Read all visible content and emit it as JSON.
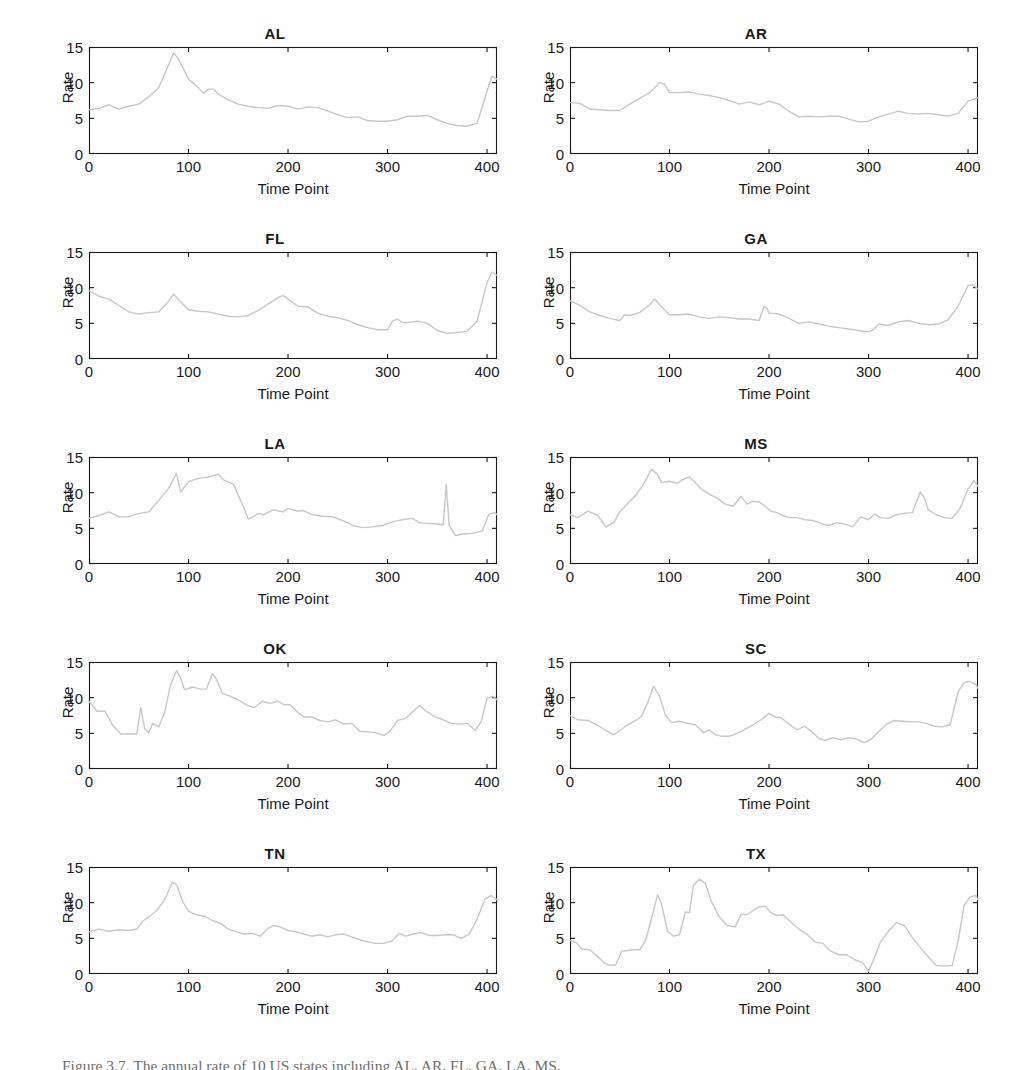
{
  "figure": {
    "caption": "Figure 3.7.   The annual rate of 10 US states including AL, AR, FL, GA, LA, MS,",
    "line_color": "#c8c8c8",
    "axis_color": "#1a1a1a"
  },
  "chart_data": [
    {
      "type": "line",
      "title": "AL",
      "xlabel": "Time Point",
      "ylabel": "Rate",
      "xlim": [
        0,
        410
      ],
      "ylim": [
        0,
        15
      ],
      "xticks": [
        0,
        100,
        200,
        300,
        400
      ],
      "yticks": [
        0,
        5,
        10,
        15
      ],
      "grid": false,
      "legend": "none",
      "x": [
        0,
        10,
        20,
        30,
        40,
        50,
        60,
        70,
        80,
        85,
        90,
        100,
        110,
        115,
        120,
        125,
        130,
        140,
        150,
        160,
        170,
        180,
        190,
        200,
        210,
        220,
        230,
        240,
        250,
        260,
        270,
        280,
        290,
        300,
        310,
        320,
        330,
        340,
        350,
        360,
        370,
        380,
        390,
        400,
        405,
        410
      ],
      "values": [
        6.2,
        6.4,
        6.9,
        6.3,
        6.7,
        7.0,
        8.0,
        9.3,
        12.5,
        14.2,
        13.3,
        10.5,
        9.3,
        8.5,
        9.1,
        9.1,
        8.4,
        7.6,
        7.0,
        6.7,
        6.5,
        6.4,
        6.8,
        6.7,
        6.3,
        6.6,
        6.5,
        6.0,
        5.5,
        5.1,
        5.2,
        4.7,
        4.6,
        4.6,
        4.8,
        5.3,
        5.3,
        5.4,
        4.8,
        4.3,
        4.0,
        3.9,
        4.3,
        8.8,
        10.9,
        10.5
      ]
    },
    {
      "type": "line",
      "title": "AR",
      "xlabel": "Time Point",
      "ylabel": "Rate",
      "xlim": [
        0,
        410
      ],
      "ylim": [
        0,
        15
      ],
      "xticks": [
        0,
        100,
        200,
        300,
        400
      ],
      "yticks": [
        0,
        5,
        10,
        15
      ],
      "grid": false,
      "legend": "none",
      "x": [
        0,
        10,
        20,
        30,
        40,
        50,
        60,
        70,
        80,
        90,
        95,
        100,
        110,
        120,
        130,
        140,
        150,
        160,
        170,
        180,
        190,
        200,
        210,
        220,
        230,
        240,
        250,
        260,
        270,
        280,
        290,
        300,
        310,
        320,
        330,
        340,
        350,
        360,
        370,
        380,
        390,
        400,
        410
      ],
      "values": [
        7.2,
        7.1,
        6.3,
        6.2,
        6.1,
        6.1,
        7.0,
        7.8,
        8.6,
        10.0,
        9.8,
        8.6,
        8.6,
        8.7,
        8.4,
        8.2,
        7.9,
        7.5,
        7.0,
        7.3,
        6.9,
        7.4,
        7.0,
        6.0,
        5.2,
        5.3,
        5.2,
        5.3,
        5.3,
        4.9,
        4.5,
        4.6,
        5.2,
        5.6,
        6.0,
        5.7,
        5.6,
        5.7,
        5.5,
        5.3,
        5.7,
        7.4,
        7.9
      ]
    },
    {
      "type": "line",
      "title": "FL",
      "xlabel": "Time Point",
      "ylabel": "Rate",
      "xlim": [
        0,
        410
      ],
      "ylim": [
        0,
        15
      ],
      "xticks": [
        0,
        100,
        200,
        300,
        400
      ],
      "yticks": [
        0,
        5,
        10,
        15
      ],
      "grid": false,
      "legend": "none",
      "x": [
        0,
        10,
        20,
        30,
        40,
        50,
        60,
        70,
        80,
        85,
        90,
        100,
        110,
        120,
        130,
        140,
        150,
        160,
        170,
        180,
        190,
        195,
        200,
        210,
        220,
        230,
        240,
        250,
        260,
        270,
        280,
        290,
        300,
        305,
        310,
        315,
        320,
        330,
        340,
        350,
        360,
        370,
        380,
        390,
        400,
        405,
        410
      ],
      "values": [
        9.6,
        8.8,
        8.4,
        7.5,
        6.6,
        6.3,
        6.5,
        6.6,
        8.1,
        9.1,
        8.3,
        6.9,
        6.7,
        6.6,
        6.3,
        6.0,
        5.9,
        6.1,
        6.8,
        7.7,
        8.6,
        8.9,
        8.4,
        7.4,
        7.3,
        6.4,
        6.0,
        5.8,
        5.4,
        4.8,
        4.4,
        4.1,
        4.1,
        5.3,
        5.6,
        5.1,
        5.1,
        5.3,
        5.0,
        4.0,
        3.6,
        3.7,
        3.9,
        5.3,
        10.7,
        12.2,
        11.7
      ]
    },
    {
      "type": "line",
      "title": "GA",
      "xlabel": "Time Point",
      "ylabel": "Rate",
      "xlim": [
        0,
        410
      ],
      "ylim": [
        0,
        15
      ],
      "xticks": [
        0,
        100,
        200,
        300,
        400
      ],
      "yticks": [
        0,
        5,
        10,
        15
      ],
      "grid": false,
      "legend": "none",
      "x": [
        0,
        10,
        20,
        30,
        40,
        50,
        55,
        60,
        70,
        80,
        85,
        90,
        100,
        110,
        120,
        130,
        140,
        150,
        160,
        170,
        180,
        190,
        195,
        198,
        200,
        205,
        210,
        220,
        230,
        240,
        250,
        260,
        270,
        280,
        290,
        300,
        305,
        310,
        320,
        330,
        340,
        350,
        360,
        370,
        380,
        390,
        400,
        405,
        410
      ],
      "values": [
        8.2,
        7.5,
        6.6,
        6.1,
        5.7,
        5.4,
        6.2,
        6.1,
        6.5,
        7.6,
        8.4,
        7.6,
        6.2,
        6.2,
        6.3,
        5.9,
        5.7,
        5.9,
        5.8,
        5.6,
        5.6,
        5.4,
        7.4,
        7.1,
        6.4,
        6.4,
        6.3,
        5.7,
        5.0,
        5.2,
        4.9,
        4.6,
        4.4,
        4.2,
        4.0,
        3.8,
        4.1,
        4.9,
        4.7,
        5.2,
        5.4,
        5.0,
        4.8,
        4.9,
        5.5,
        7.4,
        10.3,
        10.4,
        9.8
      ]
    },
    {
      "type": "line",
      "title": "LA",
      "xlabel": "Time Point",
      "ylabel": "Rate",
      "xlim": [
        0,
        410
      ],
      "ylim": [
        0,
        15
      ],
      "xticks": [
        0,
        100,
        200,
        300,
        400
      ],
      "yticks": [
        0,
        5,
        10,
        15
      ],
      "grid": false,
      "legend": "none",
      "x": [
        0,
        10,
        20,
        30,
        40,
        50,
        60,
        70,
        80,
        88,
        92,
        100,
        105,
        110,
        120,
        130,
        135,
        145,
        155,
        160,
        165,
        170,
        175,
        185,
        195,
        200,
        210,
        215,
        225,
        235,
        245,
        255,
        265,
        275,
        285,
        295,
        305,
        315,
        325,
        332,
        340,
        350,
        356,
        359,
        362,
        368,
        375,
        385,
        395,
        402,
        408,
        410
      ],
      "values": [
        6.4,
        6.8,
        7.3,
        6.6,
        6.6,
        7.1,
        7.3,
        8.9,
        10.6,
        12.7,
        10.1,
        11.5,
        11.8,
        12.0,
        12.2,
        12.6,
        11.8,
        11.2,
        8.1,
        6.3,
        6.6,
        7.1,
        6.9,
        7.6,
        7.3,
        7.8,
        7.4,
        7.5,
        6.9,
        6.7,
        6.6,
        6.1,
        5.4,
        5.1,
        5.2,
        5.4,
        5.9,
        6.2,
        6.4,
        5.8,
        5.7,
        5.6,
        5.5,
        11.1,
        5.4,
        4.0,
        4.2,
        4.3,
        4.6,
        7.0,
        7.2,
        6.9
      ]
    },
    {
      "type": "line",
      "title": "MS",
      "xlabel": "Time Point",
      "ylabel": "Rate",
      "xlim": [
        0,
        410
      ],
      "ylim": [
        0,
        15
      ],
      "xticks": [
        0,
        100,
        200,
        300,
        400
      ],
      "yticks": [
        0,
        5,
        10,
        15
      ],
      "grid": false,
      "legend": "none",
      "x": [
        0,
        8,
        18,
        28,
        36,
        44,
        50,
        58,
        66,
        74,
        82,
        88,
        92,
        100,
        108,
        114,
        120,
        126,
        132,
        140,
        148,
        156,
        164,
        172,
        178,
        184,
        190,
        196,
        202,
        208,
        214,
        220,
        228,
        236,
        244,
        252,
        260,
        268,
        276,
        284,
        292,
        300,
        306,
        312,
        320,
        328,
        336,
        344,
        352,
        356,
        360,
        368,
        376,
        384,
        392,
        400,
        406,
        410
      ],
      "values": [
        6.9,
        6.5,
        7.4,
        6.8,
        5.2,
        5.8,
        7.3,
        8.5,
        9.6,
        11.2,
        13.3,
        12.5,
        11.4,
        11.6,
        11.3,
        11.9,
        12.2,
        11.4,
        10.5,
        9.8,
        9.2,
        8.4,
        8.1,
        9.5,
        8.4,
        8.8,
        8.7,
        8.1,
        7.4,
        7.2,
        6.8,
        6.5,
        6.5,
        6.2,
        6.1,
        5.7,
        5.4,
        5.8,
        5.6,
        5.2,
        6.6,
        6.2,
        7.0,
        6.5,
        6.4,
        6.9,
        7.1,
        7.2,
        10.1,
        9.3,
        7.6,
        6.9,
        6.5,
        6.4,
        7.8,
        10.5,
        11.7,
        10.9
      ]
    },
    {
      "type": "line",
      "title": "OK",
      "xlabel": "Time Point",
      "ylabel": "Rate",
      "xlim": [
        0,
        410
      ],
      "ylim": [
        0,
        15
      ],
      "xticks": [
        0,
        100,
        200,
        300,
        400
      ],
      "yticks": [
        0,
        5,
        10,
        15
      ],
      "grid": false,
      "legend": "none",
      "x": [
        0,
        8,
        16,
        24,
        32,
        40,
        48,
        52,
        56,
        60,
        64,
        70,
        76,
        82,
        88,
        92,
        96,
        104,
        112,
        118,
        124,
        128,
        134,
        142,
        150,
        158,
        166,
        174,
        182,
        190,
        196,
        202,
        210,
        216,
        224,
        232,
        240,
        248,
        256,
        264,
        272,
        280,
        288,
        296,
        302,
        310,
        318,
        326,
        332,
        340,
        348,
        356,
        364,
        372,
        380,
        388,
        394,
        400,
        406,
        410
      ],
      "values": [
        9.5,
        8.1,
        8.1,
        6.1,
        4.9,
        4.9,
        4.9,
        8.6,
        5.6,
        5.1,
        6.4,
        5.9,
        7.9,
        11.8,
        13.8,
        12.8,
        11.1,
        11.5,
        11.2,
        11.2,
        13.4,
        12.6,
        10.6,
        10.2,
        9.7,
        9.0,
        8.6,
        9.5,
        9.2,
        9.5,
        9.0,
        9.0,
        7.9,
        7.3,
        7.3,
        6.8,
        6.6,
        6.9,
        6.3,
        6.4,
        5.3,
        5.2,
        5.1,
        4.7,
        5.2,
        6.8,
        7.1,
        8.1,
        8.9,
        8.0,
        7.3,
        6.9,
        6.4,
        6.3,
        6.4,
        5.4,
        6.6,
        9.9,
        10.2,
        9.7
      ]
    },
    {
      "type": "line",
      "title": "SC",
      "xlabel": "Time Point",
      "ylabel": "Rate",
      "xlim": [
        0,
        410
      ],
      "ylim": [
        0,
        15
      ],
      "xticks": [
        0,
        100,
        200,
        300,
        400
      ],
      "yticks": [
        0,
        5,
        10,
        15
      ],
      "grid": false,
      "legend": "none",
      "x": [
        0,
        8,
        18,
        28,
        36,
        44,
        50,
        58,
        66,
        72,
        78,
        84,
        90,
        96,
        102,
        110,
        118,
        126,
        134,
        140,
        146,
        152,
        160,
        168,
        176,
        184,
        192,
        200,
        206,
        212,
        220,
        228,
        236,
        244,
        250,
        256,
        264,
        272,
        280,
        288,
        296,
        302,
        310,
        318,
        326,
        334,
        342,
        350,
        358,
        366,
        374,
        382,
        390,
        396,
        402,
        408,
        410
      ],
      "values": [
        7.5,
        6.9,
        6.8,
        6.1,
        5.4,
        4.8,
        5.4,
        6.2,
        6.8,
        7.4,
        9.3,
        11.6,
        10.2,
        7.5,
        6.5,
        6.7,
        6.4,
        6.2,
        5.1,
        5.5,
        4.8,
        4.6,
        4.6,
        5.0,
        5.6,
        6.2,
        6.9,
        7.8,
        7.3,
        7.2,
        6.3,
        5.5,
        6.0,
        5.1,
        4.3,
        4.0,
        4.4,
        4.1,
        4.4,
        4.2,
        3.7,
        4.1,
        5.2,
        6.3,
        6.8,
        6.7,
        6.6,
        6.6,
        6.4,
        6.0,
        5.9,
        6.2,
        10.8,
        12.1,
        12.3,
        11.8,
        11.3
      ]
    },
    {
      "type": "line",
      "title": "TN",
      "xlabel": "Time Point",
      "ylabel": "Rate",
      "xlim": [
        0,
        410
      ],
      "ylim": [
        0,
        15
      ],
      "xticks": [
        0,
        100,
        200,
        300,
        400
      ],
      "yticks": [
        0,
        5,
        10,
        15
      ],
      "grid": false,
      "legend": "none",
      "x": [
        0,
        10,
        20,
        30,
        40,
        48,
        54,
        60,
        68,
        76,
        84,
        88,
        94,
        100,
        108,
        116,
        124,
        132,
        140,
        148,
        156,
        164,
        172,
        180,
        186,
        192,
        200,
        208,
        216,
        224,
        232,
        240,
        248,
        256,
        264,
        272,
        280,
        288,
        296,
        304,
        312,
        318,
        326,
        334,
        342,
        350,
        358,
        366,
        374,
        382,
        390,
        398,
        404,
        410
      ],
      "values": [
        5.9,
        6.3,
        6.0,
        6.2,
        6.1,
        6.3,
        7.4,
        8.0,
        8.9,
        10.4,
        12.9,
        12.5,
        10.2,
        8.8,
        8.3,
        8.1,
        7.5,
        7.1,
        6.3,
        5.9,
        5.6,
        5.7,
        5.3,
        6.4,
        6.8,
        6.6,
        6.1,
        5.9,
        5.6,
        5.3,
        5.5,
        5.2,
        5.5,
        5.6,
        5.2,
        4.8,
        4.5,
        4.3,
        4.3,
        4.6,
        5.7,
        5.3,
        5.6,
        5.8,
        5.4,
        5.4,
        5.5,
        5.5,
        5.0,
        5.6,
        7.7,
        10.5,
        11.0,
        10.4
      ]
    },
    {
      "type": "line",
      "title": "TX",
      "xlabel": "Time Point",
      "ylabel": "Rate",
      "xlim": [
        0,
        410
      ],
      "ylim": [
        0,
        15
      ],
      "xticks": [
        0,
        100,
        200,
        300,
        400
      ],
      "yticks": [
        0,
        5,
        10,
        15
      ],
      "grid": false,
      "legend": "none",
      "x": [
        0,
        6,
        12,
        20,
        28,
        34,
        40,
        46,
        52,
        58,
        64,
        70,
        76,
        82,
        88,
        92,
        98,
        104,
        110,
        116,
        120,
        124,
        130,
        136,
        142,
        150,
        158,
        166,
        172,
        178,
        184,
        190,
        196,
        202,
        208,
        214,
        222,
        230,
        238,
        246,
        254,
        262,
        270,
        278,
        286,
        294,
        300,
        306,
        312,
        320,
        328,
        336,
        344,
        352,
        360,
        368,
        376,
        384,
        390,
        396,
        402,
        408,
        410
      ],
      "values": [
        4.7,
        4.4,
        3.5,
        3.4,
        2.4,
        1.6,
        1.2,
        1.3,
        3.2,
        3.3,
        3.4,
        3.4,
        4.7,
        7.8,
        11.1,
        9.8,
        6.0,
        5.3,
        5.5,
        8.7,
        8.6,
        12.4,
        13.3,
        12.7,
        10.2,
        8.0,
        6.8,
        6.6,
        8.4,
        8.3,
        8.9,
        9.4,
        9.5,
        8.6,
        8.2,
        8.3,
        7.3,
        6.3,
        5.6,
        4.5,
        4.3,
        3.2,
        2.7,
        2.7,
        2.0,
        1.6,
        0.4,
        2.3,
        4.5,
        6.0,
        7.2,
        6.8,
        5.1,
        3.7,
        2.4,
        1.2,
        1.1,
        1.2,
        4.6,
        9.6,
        10.8,
        11.0,
        10.4
      ]
    }
  ]
}
